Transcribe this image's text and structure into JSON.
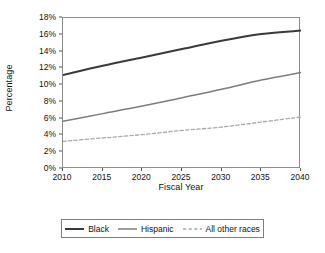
{
  "chart_data": {
    "type": "line",
    "title": "",
    "xlabel": "Fiscal Year",
    "ylabel": "Percentage",
    "x": [
      2010,
      2015,
      2020,
      2025,
      2030,
      2035,
      2040
    ],
    "xlim": [
      2010,
      2040
    ],
    "ylim": [
      0,
      18
    ],
    "grid": false,
    "legend_position": "bottom",
    "y_tick_labels": [
      "0%",
      "2%",
      "4%",
      "6%",
      "8%",
      "10%",
      "12%",
      "14%",
      "16%",
      "18%"
    ],
    "y_tick_values": [
      0,
      2,
      4,
      6,
      8,
      10,
      12,
      14,
      16,
      18
    ],
    "x_tick_labels": [
      "2010",
      "2015",
      "2020",
      "2025",
      "2030",
      "2035",
      "2040"
    ],
    "series": [
      {
        "name": "Black",
        "color": "#3a3a3a",
        "style": "solid",
        "width": 2.0,
        "values": [
          11.2,
          12.3,
          13.3,
          14.3,
          15.3,
          16.1,
          16.5
        ]
      },
      {
        "name": "Hispanic",
        "color": "#7d7d7d",
        "style": "solid",
        "width": 1.5,
        "values": [
          5.7,
          6.6,
          7.5,
          8.5,
          9.5,
          10.6,
          11.5
        ]
      },
      {
        "name": "All other races",
        "color": "#a8a8a8",
        "style": "dashed",
        "width": 1.3,
        "values": [
          3.3,
          3.7,
          4.1,
          4.6,
          5.0,
          5.6,
          6.2
        ]
      }
    ]
  },
  "legend": {
    "items": [
      {
        "label": "Black"
      },
      {
        "label": "Hispanic"
      },
      {
        "label": "All other races"
      }
    ]
  },
  "axes": {
    "y_title": "Percentage",
    "x_title": "Fiscal Year"
  }
}
